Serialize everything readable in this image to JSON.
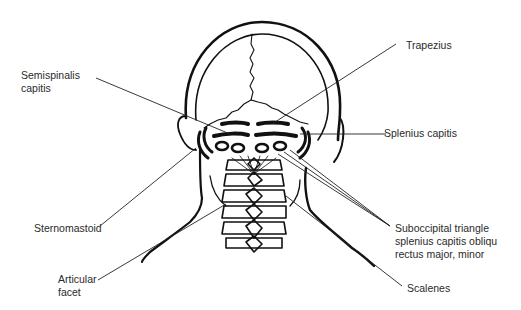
{
  "diagram": {
    "labels": {
      "trapezius": "Trapezius",
      "semispinalis_line1": "Semispinalis",
      "semispinalis_line2": "capitis",
      "splenius_capitis": "Splenius capitis",
      "sternomastoid": "Sternomastoid",
      "suboccipital_line1": "Suboccipital triangle",
      "suboccipital_line2": "splenius capitis obliqu",
      "suboccipital_line3": "rectus major, minor",
      "articular_line1": "Articular",
      "articular_line2": "facet",
      "scalenes": "Scalenes"
    },
    "colors": {
      "ink": "#111111",
      "text": "#2a2a2a",
      "background": "#ffffff"
    }
  }
}
